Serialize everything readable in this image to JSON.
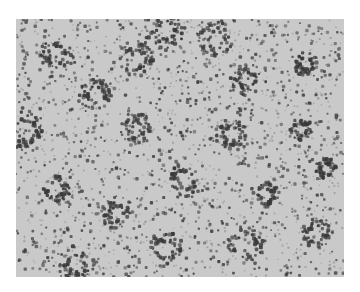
{
  "image": {
    "description": "grayscale micrograph showing a dense field of small dark particles with darker ring-like clusters",
    "background_color": "#c9c9c9",
    "dot_color": "#3a3a3a",
    "frame": {
      "x": 16,
      "y": 19,
      "width": 328,
      "height": 258
    },
    "clusters": [
      [
        40,
        35
      ],
      [
        150,
        12
      ],
      [
        230,
        60
      ],
      [
        290,
        45
      ],
      [
        10,
        110
      ],
      [
        80,
        75
      ],
      [
        120,
        110
      ],
      [
        215,
        115
      ],
      [
        285,
        110
      ],
      [
        40,
        170
      ],
      [
        100,
        195
      ],
      [
        170,
        160
      ],
      [
        250,
        175
      ],
      [
        310,
        150
      ],
      [
        150,
        230
      ],
      [
        60,
        245
      ],
      [
        230,
        225
      ],
      [
        300,
        215
      ],
      [
        120,
        40
      ],
      [
        200,
        20
      ]
    ]
  }
}
